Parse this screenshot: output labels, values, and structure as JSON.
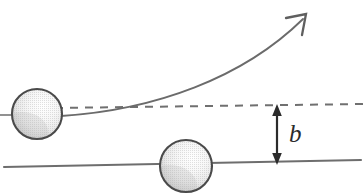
{
  "diagram": {
    "type": "physics-schematic",
    "canvas": {
      "width": 364,
      "height": 194,
      "background": "#ffffff"
    },
    "labels": {
      "impact_parameter": "b"
    },
    "colors": {
      "line_gray": "#6e6e6e",
      "dashed_gray": "#707070",
      "sphere_outline": "#4a4a4a",
      "sphere_light": "#fbfbfb",
      "sphere_mid": "#ededed",
      "sphere_shadow": "#c6c6c6",
      "arrow_dark": "#2b2b2b",
      "label_color": "#2b2b2b"
    },
    "elements": {
      "projectile_sphere": {
        "name": "incoming-particle",
        "cx": 37,
        "cy": 114,
        "r": 25
      },
      "target_sphere": {
        "name": "target-particle",
        "cx": 186,
        "cy": 166,
        "r": 26
      },
      "baseline": {
        "name": "target-axis-line",
        "x1": 4,
        "y1": 167,
        "x2": 361,
        "y2": 160
      },
      "dashed_trajectory": {
        "name": "undeflected-path",
        "x1": 55,
        "y1": 108,
        "x2": 364,
        "y2": 104,
        "dash": "8 7"
      },
      "incoming_stub": {
        "name": "incoming-path-stub",
        "x1": 0,
        "y1": 115,
        "x2": 14,
        "y2": 115
      },
      "curved_trajectory": {
        "name": "deflected-path",
        "start_x": 61,
        "start_y": 116,
        "ctrl1_x": 155,
        "ctrl1_y": 110,
        "ctrl2_x": 243,
        "ctrl2_y": 78,
        "end_x": 303,
        "end_y": 19
      },
      "arrowhead": {
        "name": "trajectory-arrowhead",
        "tip_x": 307,
        "tip_y": 14,
        "barb1_x": 285,
        "barb1_y": 19,
        "barb2_x": 302,
        "barb2_y": 36
      },
      "measure_arrow": {
        "name": "impact-parameter-arrow",
        "x": 277,
        "y_top": 105,
        "y_bottom": 164
      },
      "label_position": {
        "x": 289,
        "y": 142
      }
    }
  }
}
